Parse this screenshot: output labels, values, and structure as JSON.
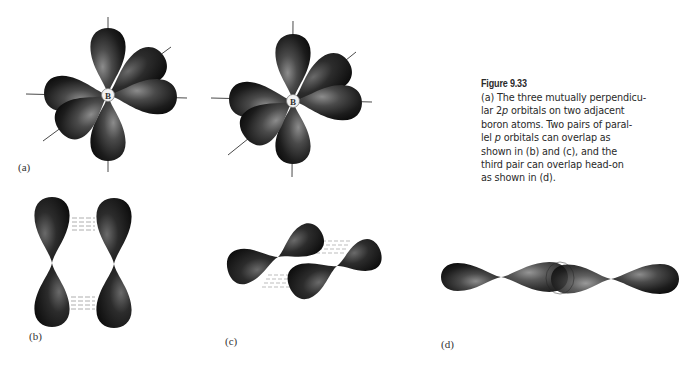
{
  "figure": {
    "title": "Figure 9.33",
    "caption_lines": [
      [
        "(a) The three mutually perpendicu-"
      ],
      [
        "lar 2",
        {
          "italic": "p"
        },
        " orbitals on two adjacent"
      ],
      [
        "boron atoms. Two pairs of paral-"
      ],
      [
        "lel ",
        {
          "italic": "p"
        },
        " orbitals can overlap as"
      ],
      [
        "shown in (b) and (c), and the"
      ],
      [
        "third pair can overlap head-on"
      ],
      [
        "as shown in (d)."
      ]
    ],
    "caption_text": "(a) The three mutually perpendicular 2p orbitals on two adjacent boron atoms. Two pairs of parallel p orbitals can overlap as shown in (b) and (c), and the third pair can overlap head-on as shown in (d)."
  },
  "panels": {
    "a": {
      "label": "(a)",
      "atom_symbol": "B",
      "atoms": [
        {
          "symbol": "B",
          "center": [
            108,
            95
          ]
        },
        {
          "symbol": "B",
          "center": [
            293,
            101
          ]
        }
      ]
    },
    "b": {
      "label": "(b)",
      "description": "side-by-side overlap of two parallel vertical p orbitals"
    },
    "c": {
      "label": "(c)",
      "description": "side-by-side overlap of two parallel diagonal p orbitals"
    },
    "d": {
      "label": "(d)",
      "description": "head-on overlap of two collinear p orbitals"
    }
  },
  "colors": {
    "lobe_dark": "#141414",
    "lobe_light": "#8a8a8a",
    "axis_line": "#4a4a4a",
    "text": "#2a2a2a",
    "background": "#ffffff"
  }
}
